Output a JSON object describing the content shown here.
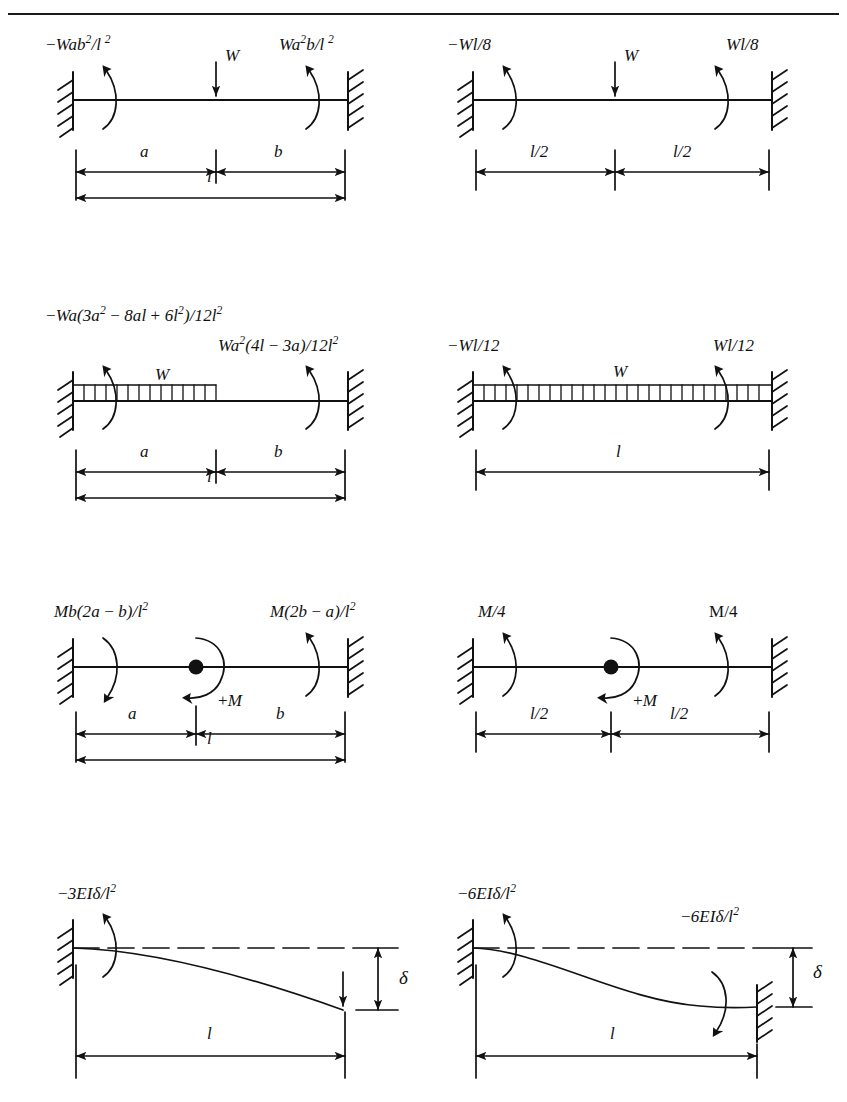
{
  "page": {
    "rule_color": "#1a1a1a",
    "ink_color": "#111111",
    "background": "#ffffff"
  },
  "figures": [
    {
      "id": "fig-1-1",
      "case": "point-load-offset",
      "left_moment": "−Wab²/l ²",
      "left_moment_parts": {
        "sign": "−",
        "base": "Wab",
        "sup1": "2",
        "mid": "/l",
        "sup2": "2"
      },
      "right_moment": "Wa²b/l ²",
      "load_label": "W",
      "load_type": "point",
      "dimensions": [
        {
          "label": "a",
          "span": "left"
        },
        {
          "label": "b",
          "span": "right"
        },
        {
          "label": "l",
          "span": "full"
        }
      ]
    },
    {
      "id": "fig-1-2",
      "case": "point-load-centre",
      "left_moment": "−Wl/8",
      "right_moment": "Wl/8",
      "load_label": "W",
      "load_type": "point",
      "dimensions": [
        {
          "label": "l/2",
          "span": "left"
        },
        {
          "label": "l/2",
          "span": "right"
        }
      ]
    },
    {
      "id": "fig-2-1",
      "case": "partial-udl",
      "left_moment": "−Wa(3a² − 8al + 6l²)/12l²",
      "right_moment": "Wa²(4l − 3a)/12l²",
      "load_label": "W",
      "load_type": "distributed-partial",
      "dimensions": [
        {
          "label": "a",
          "span": "left"
        },
        {
          "label": "b",
          "span": "right"
        },
        {
          "label": "l",
          "span": "full"
        }
      ]
    },
    {
      "id": "fig-2-2",
      "case": "full-udl",
      "left_moment": "−Wl/12",
      "right_moment": "Wl/12",
      "load_label": "W",
      "load_type": "distributed-full",
      "dimensions": [
        {
          "label": "l",
          "span": "full"
        }
      ]
    },
    {
      "id": "fig-3-1",
      "case": "applied-moment-offset",
      "left_moment": "Mb(2a − b)/l²",
      "right_moment": "M(2b − a)/l²",
      "load_label": "+M",
      "load_type": "moment",
      "dimensions": [
        {
          "label": "a",
          "span": "left"
        },
        {
          "label": "b",
          "span": "right"
        },
        {
          "label": "l",
          "span": "full"
        }
      ]
    },
    {
      "id": "fig-3-2",
      "case": "applied-moment-centre",
      "left_moment": "M/4",
      "right_moment": "M/4",
      "load_label": "+M",
      "load_type": "moment",
      "dimensions": [
        {
          "label": "l/2",
          "span": "left"
        },
        {
          "label": "l/2",
          "span": "right"
        }
      ]
    },
    {
      "id": "fig-4-1",
      "case": "propped-cantilever-settlement",
      "left_moment": "−3EIδ/l²",
      "right_moment": "",
      "load_label": "δ",
      "load_type": "settlement",
      "dimensions": [
        {
          "label": "l",
          "span": "full"
        }
      ]
    },
    {
      "id": "fig-4-2",
      "case": "fixed-fixed-settlement",
      "left_moment": "−6EIδ/l²",
      "right_moment": "−6EIδ/l²",
      "load_label": "δ",
      "load_type": "settlement",
      "dimensions": [
        {
          "label": "l",
          "span": "full"
        }
      ]
    }
  ],
  "symbols": {
    "W": "W",
    "M_plus": "+M",
    "delta": "δ",
    "a": "a",
    "b": "b",
    "l": "l",
    "l_half": "l/2"
  }
}
